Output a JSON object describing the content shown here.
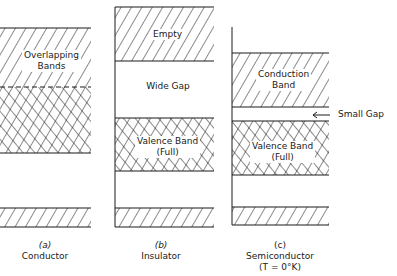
{
  "colors": {
    "ink": "#1a1a1a",
    "background": "#ffffff"
  },
  "panels": [
    {
      "id": "a",
      "letter": "(a)",
      "name": "Conductor",
      "bands": [
        {
          "label_line1": "Overlapping",
          "label_line2": "Bands",
          "fill": "hatch+crosshatch"
        }
      ]
    },
    {
      "id": "b",
      "letter": "(b)",
      "name": "Insulator",
      "bands": [
        {
          "label": "Empty",
          "fill": "hatch"
        },
        {
          "gap_label": "Wide Gap"
        },
        {
          "label_line1": "Valence Band",
          "label_line2": "(Full)",
          "fill": "crosshatch"
        }
      ]
    },
    {
      "id": "c",
      "letter": "(c)",
      "name": "Semiconductor",
      "condition": "(T  =  0°K)",
      "bands": [
        {
          "label_line1": "Conduction",
          "label_line2": "Band",
          "fill": "hatch"
        },
        {
          "gap_label": "Small Gap",
          "arrow": "left-arrow"
        },
        {
          "label_line1": "Valence Band",
          "label_line2": "(Full)",
          "fill": "crosshatch"
        }
      ]
    }
  ]
}
